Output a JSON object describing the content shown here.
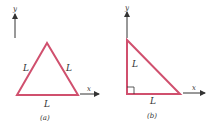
{
  "colors": {
    "triangle": "#d0506e",
    "axis": "#333333"
  },
  "panels": [
    {
      "id": "a",
      "caption": "(a)",
      "axis_y_label": "y",
      "axis_x_label": "x",
      "side_labels": [
        "L",
        "L",
        "L"
      ],
      "shape": "equilateral-triangle"
    },
    {
      "id": "b",
      "caption": "(b)",
      "axis_y_label": "y",
      "axis_x_label": "x",
      "side_labels": [
        "L",
        "L"
      ],
      "shape": "right-isosceles-triangle"
    }
  ]
}
